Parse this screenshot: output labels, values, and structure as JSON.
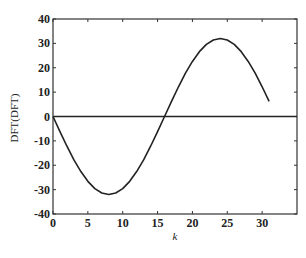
{
  "chart_data": {
    "type": "line",
    "title": "",
    "xlabel": "k",
    "ylabel": "DFT(DFT)",
    "xlim": [
      0,
      35
    ],
    "ylim": [
      -40,
      40
    ],
    "xticks": [
      0,
      5,
      10,
      15,
      20,
      25,
      30
    ],
    "yticks": [
      -40,
      -30,
      -20,
      -10,
      0,
      10,
      20,
      30,
      40
    ],
    "grid": false,
    "legend": null,
    "series": [
      {
        "name": "DFT(DFT)",
        "x": [
          0,
          1,
          2,
          3,
          4,
          5,
          6,
          7,
          8,
          9,
          10,
          11,
          12,
          13,
          14,
          15,
          16,
          17,
          18,
          19,
          20,
          21,
          22,
          23,
          24,
          25,
          26,
          27,
          28,
          29,
          30,
          31
        ],
        "values": [
          0,
          -6.2,
          -12.2,
          -17.8,
          -22.6,
          -26.6,
          -29.6,
          -31.4,
          -32,
          -31.4,
          -29.6,
          -26.6,
          -22.6,
          -17.8,
          -12.2,
          -6.2,
          0,
          6.2,
          12.2,
          17.8,
          22.6,
          26.6,
          29.6,
          31.4,
          32,
          31.4,
          29.6,
          26.6,
          22.6,
          17.8,
          12.2,
          6.2
        ]
      }
    ],
    "reference_lines": [
      {
        "axis": "y",
        "value": 0
      }
    ]
  }
}
